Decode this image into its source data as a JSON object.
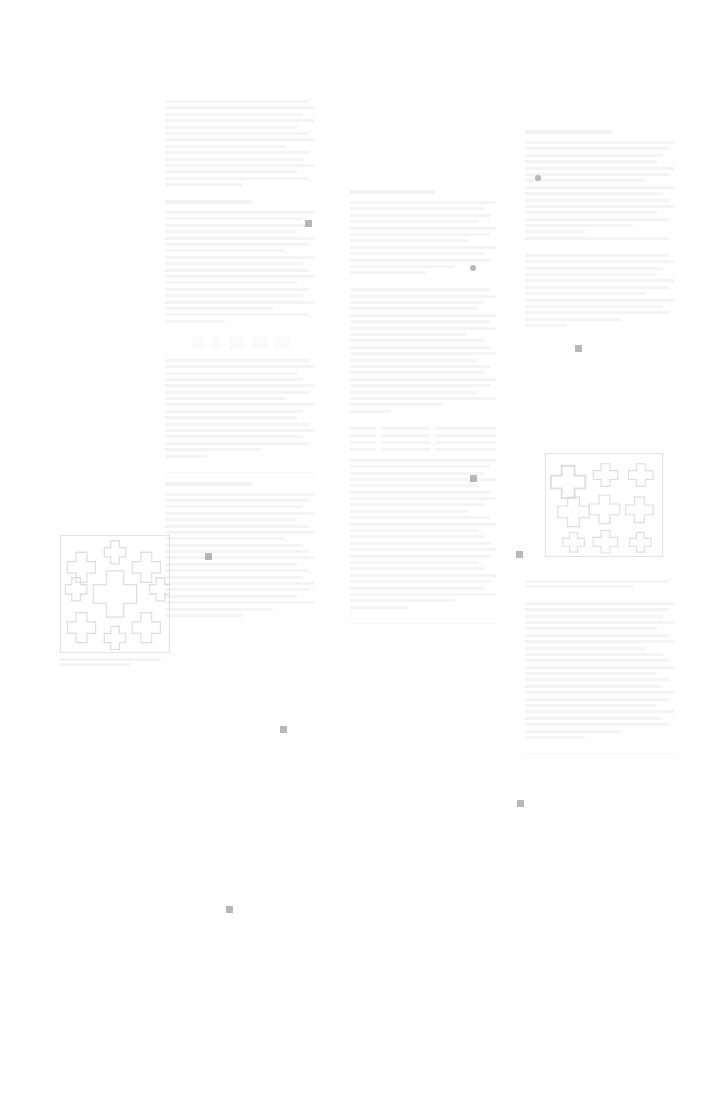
{
  "page": {
    "width": 708,
    "height": 1104,
    "background": "#ffffff",
    "ink_color": "#4a4a4a",
    "marker_color": "#8d8d8d",
    "appearance": "heavily faded / washed-out scan; body text is illegible at capture exposure",
    "legible_text": ""
  },
  "layout": {
    "type": "three-column document page with one left-margin figure",
    "columns": [
      {
        "name": "left-column",
        "x": 165,
        "y": 100,
        "width": 150,
        "height": 912
      },
      {
        "name": "middle-column",
        "x": 350,
        "y": 190,
        "width": 146,
        "height": 792
      },
      {
        "name": "right-column",
        "x": 525,
        "y": 130,
        "width": 150,
        "height": 852
      }
    ],
    "margin_figure": {
      "name": "margin-figure",
      "x": 60,
      "y": 535,
      "width": 110,
      "height": 125
    }
  },
  "figures": [
    {
      "id": "margin-figure",
      "motif": "cross-polyomino tiling",
      "description": "bordered square containing a recursive cluster of plus/cross shaped tiles",
      "caption": ""
    },
    {
      "id": "right-column-figure",
      "motif": "cross-polyomino tiling",
      "description": "bordered square containing plus/cross shaped tiles of several sizes",
      "caption": ""
    }
  ],
  "markers": [
    {
      "name": "marker-1",
      "x": 305,
      "y": 220,
      "shape": "square"
    },
    {
      "name": "marker-2",
      "x": 535,
      "y": 175,
      "shape": "dot"
    },
    {
      "name": "marker-3",
      "x": 470,
      "y": 265,
      "shape": "dot"
    },
    {
      "name": "marker-4",
      "x": 575,
      "y": 345,
      "shape": "square"
    },
    {
      "name": "marker-5",
      "x": 470,
      "y": 475,
      "shape": "square"
    },
    {
      "name": "marker-6",
      "x": 205,
      "y": 553,
      "shape": "square"
    },
    {
      "name": "marker-7",
      "x": 516,
      "y": 551,
      "shape": "square"
    },
    {
      "name": "marker-8",
      "x": 280,
      "y": 726,
      "shape": "square"
    },
    {
      "name": "marker-9",
      "x": 517,
      "y": 800,
      "shape": "square"
    },
    {
      "name": "marker-10",
      "x": 226,
      "y": 906,
      "shape": "square"
    }
  ],
  "blocks": {
    "left": [
      {
        "name": "lead-paragraph",
        "kind": "paragraph",
        "lines": 14
      },
      {
        "name": "section-a",
        "kind": "paragraph",
        "lines": 18,
        "heading": true
      },
      {
        "name": "section-a-cont",
        "kind": "paragraph",
        "lines": 16
      },
      {
        "name": "section-b",
        "kind": "paragraph",
        "lines": 20,
        "heading": true
      },
      {
        "name": "dense-block",
        "kind": "dense",
        "lines": 22
      }
    ],
    "middle": [
      {
        "name": "mid-block-1",
        "kind": "paragraph",
        "lines": 12,
        "heading": true
      },
      {
        "name": "mid-block-2",
        "kind": "paragraph",
        "lines": 20
      },
      {
        "name": "mid-block-3",
        "kind": "paragraph",
        "lines": 24
      },
      {
        "name": "mid-block-4",
        "kind": "dense",
        "lines": 20
      }
    ],
    "right": [
      {
        "name": "right-block-1",
        "kind": "paragraph",
        "lines": 16,
        "heading": true
      },
      {
        "name": "right-block-2",
        "kind": "paragraph",
        "lines": 12
      },
      {
        "name": "right-block-3",
        "kind": "paragraph",
        "lines": 22
      },
      {
        "name": "right-block-4",
        "kind": "dense",
        "lines": 18
      }
    ]
  }
}
